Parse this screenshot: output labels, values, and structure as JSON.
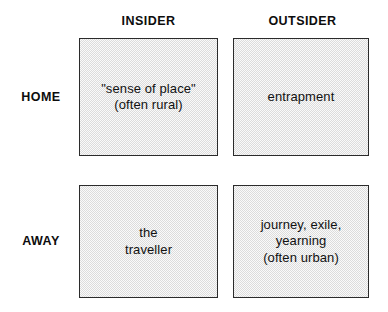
{
  "figure": {
    "type": "2x2-matrix-diagram",
    "background_color": "#ffffff",
    "cell_fill_color": "#dcdcdc",
    "cell_border_color": "#2b2b2b",
    "text_color": "#111111"
  },
  "columns": [
    {
      "label": "INSIDER"
    },
    {
      "label": "OUTSIDER"
    }
  ],
  "rows": [
    {
      "label": "HOME"
    },
    {
      "label": "AWAY"
    }
  ],
  "cells": [
    [
      {
        "text": "\"sense of place\"\n(often rural)"
      },
      {
        "text": "entrapment"
      }
    ],
    [
      {
        "text": "the\ntraveller"
      },
      {
        "text": "journey, exile,\nyearning\n(often urban)"
      }
    ]
  ]
}
